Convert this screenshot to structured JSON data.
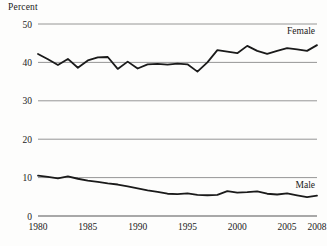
{
  "chart_data": {
    "type": "line",
    "title": "",
    "xlabel": "",
    "ylabel": "Percent",
    "xlim": [
      1980,
      2008
    ],
    "ylim": [
      0,
      50
    ],
    "grid": true,
    "legend_position": "inline-right",
    "xticks": [
      "1980",
      "1985",
      "1990",
      "1995",
      "2000",
      "2005",
      "2008"
    ],
    "xtick_values": [
      1980,
      1985,
      1990,
      1995,
      2000,
      2005,
      2008
    ],
    "yticks": [
      "0",
      "10",
      "20",
      "30",
      "40",
      "50"
    ],
    "ytick_values": [
      0,
      10,
      20,
      30,
      40,
      50
    ],
    "x": [
      1980,
      1981,
      1982,
      1983,
      1984,
      1985,
      1986,
      1987,
      1988,
      1989,
      1990,
      1991,
      1992,
      1993,
      1994,
      1995,
      1996,
      1997,
      1998,
      1999,
      2000,
      2001,
      2002,
      2003,
      2004,
      2005,
      2006,
      2007,
      2008
    ],
    "series": [
      {
        "name": "Female",
        "color": "#1a1a1a",
        "label": "Female",
        "values": [
          42.2,
          40.8,
          39.3,
          40.9,
          38.6,
          40.5,
          41.3,
          41.4,
          38.3,
          40.2,
          38.4,
          39.5,
          39.6,
          39.4,
          39.7,
          39.5,
          37.6,
          40.0,
          43.2,
          42.8,
          42.4,
          44.3,
          43.0,
          42.2,
          43.0,
          43.7,
          43.4,
          43.0,
          44.5
        ]
      },
      {
        "name": "Male",
        "color": "#1a1a1a",
        "label": "Male",
        "values": [
          10.5,
          10.2,
          9.8,
          10.3,
          9.7,
          9.2,
          8.9,
          8.5,
          8.2,
          7.7,
          7.2,
          6.7,
          6.3,
          5.8,
          5.7,
          5.9,
          5.5,
          5.4,
          5.5,
          6.5,
          6.1,
          6.2,
          6.4,
          5.8,
          5.6,
          5.9,
          5.4,
          4.9,
          5.3
        ]
      }
    ]
  }
}
